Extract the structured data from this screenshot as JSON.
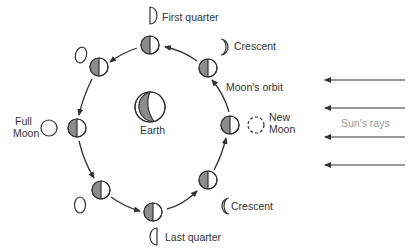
{
  "colors": {
    "stroke": "#333333",
    "shade": "#8c8c8c",
    "lit": "#ffffff",
    "rays_label": "#9a9a9a"
  },
  "labels": {
    "first_quarter": "First quarter",
    "crescent_top": "Crescent",
    "moons_orbit": "Moon's orbit",
    "new_moon_line1": "New",
    "new_moon_line2": "Moon",
    "sun_rays": "Sun's rays",
    "crescent_bottom": "Crescent",
    "last_quarter": "Last quarter",
    "full_moon_line1": "Full",
    "full_moon_line2": "Moon",
    "earth": "Earth"
  },
  "orbit_moons": [
    {
      "id": "top",
      "x": 150,
      "y": 45
    },
    {
      "id": "upper-right",
      "x": 208,
      "y": 68
    },
    {
      "id": "right",
      "x": 230,
      "y": 125
    },
    {
      "id": "lower-right",
      "x": 208,
      "y": 180
    },
    {
      "id": "bottom",
      "x": 153,
      "y": 212
    },
    {
      "id": "lower-left",
      "x": 101,
      "y": 190
    },
    {
      "id": "left",
      "x": 77,
      "y": 128
    },
    {
      "id": "upper-left",
      "x": 99,
      "y": 67
    }
  ],
  "phases": [
    {
      "name": "First quarter",
      "shape": "half-right"
    },
    {
      "name": "Waxing crescent",
      "shape": "crescent-right"
    },
    {
      "name": "New Moon",
      "shape": "dashed-circle"
    },
    {
      "name": "Waning crescent",
      "shape": "crescent-left"
    },
    {
      "name": "Last quarter",
      "shape": "half-left"
    },
    {
      "name": "Gibbous (waning)",
      "shape": "oval"
    },
    {
      "name": "Full Moon",
      "shape": "circle"
    },
    {
      "name": "Gibbous (waxing)",
      "shape": "oval"
    }
  ],
  "sun_rays_count": 4
}
